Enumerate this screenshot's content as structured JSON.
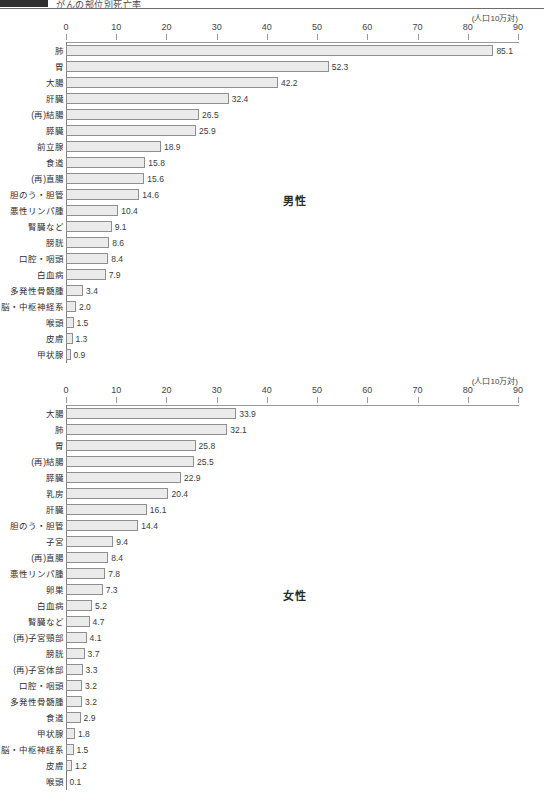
{
  "header": {
    "title": "がんの部位別死亡率",
    "swatch_color": "#2f2f2f"
  },
  "style": {
    "bar_fill": "#ebebeb",
    "bar_border": "#8f8f8f",
    "axis_color": "#9a9a9a",
    "text_color": "#3b3b3b"
  },
  "chart_data": [
    {
      "type": "bar",
      "orientation": "horizontal",
      "title": "男性",
      "unit_label": "(人口10万対)",
      "xlabel": "",
      "ylabel": "",
      "xlim": [
        0,
        90
      ],
      "ticks": [
        0,
        10,
        20,
        30,
        40,
        50,
        60,
        70,
        80,
        90
      ],
      "grid": false,
      "legend": "none",
      "categories": [
        "肺",
        "胃",
        "大腸",
        "肝臓",
        "(再)結腸",
        "膵臓",
        "前立腺",
        "食道",
        "(再)直腸",
        "胆のう・胆管",
        "悪性リンパ腫",
        "腎臓など",
        "膀胱",
        "口腔・咽頭",
        "白血病",
        "多発性骨髄腫",
        "脳・中枢神経系",
        "喉頭",
        "皮膚",
        "甲状腺"
      ],
      "values": [
        85.1,
        52.3,
        42.2,
        32.4,
        26.5,
        25.9,
        18.9,
        15.8,
        15.6,
        14.6,
        10.4,
        9.1,
        8.6,
        8.4,
        7.9,
        3.4,
        2.0,
        1.5,
        1.3,
        0.9
      ],
      "value_labels": [
        "85.1",
        "52.3",
        "42.2",
        "32.4",
        "26.5",
        "25.9",
        "18.9",
        "15.8",
        "15.6",
        "14.6",
        "10.4",
        "9.1",
        "8.6",
        "8.4",
        "7.9",
        "3.4",
        "2.0",
        "1.5",
        "1.3",
        "0.9"
      ]
    },
    {
      "type": "bar",
      "orientation": "horizontal",
      "title": "女性",
      "unit_label": "(人口10万対)",
      "xlabel": "",
      "ylabel": "",
      "xlim": [
        0,
        90
      ],
      "ticks": [
        0,
        10,
        20,
        30,
        40,
        50,
        60,
        70,
        80,
        90
      ],
      "grid": false,
      "legend": "none",
      "categories": [
        "大腸",
        "肺",
        "胃",
        "(再)結腸",
        "膵臓",
        "乳房",
        "肝臓",
        "胆のう・胆管",
        "子宮",
        "(再)直腸",
        "悪性リンパ腫",
        "卵巣",
        "白血病",
        "腎臓など",
        "(再)子宮頸部",
        "膀胱",
        "(再)子宮体部",
        "口腔・咽頭",
        "多発性骨髄腫",
        "食道",
        "甲状腺",
        "脳・中枢神経系",
        "皮膚",
        "喉頭"
      ],
      "values": [
        33.9,
        32.1,
        25.8,
        25.5,
        22.9,
        20.4,
        16.1,
        14.4,
        9.4,
        8.4,
        7.8,
        7.3,
        5.2,
        4.7,
        4.1,
        3.7,
        3.3,
        3.2,
        3.2,
        2.9,
        1.8,
        1.5,
        1.2,
        0.1
      ],
      "value_labels": [
        "33.9",
        "32.1",
        "25.8",
        "25.5",
        "22.9",
        "20.4",
        "16.1",
        "14.4",
        "9.4",
        "8.4",
        "7.8",
        "7.3",
        "5.2",
        "4.7",
        "4.1",
        "3.7",
        "3.3",
        "3.2",
        "3.2",
        "2.9",
        "1.8",
        "1.5",
        "1.2",
        "0.1"
      ]
    }
  ]
}
